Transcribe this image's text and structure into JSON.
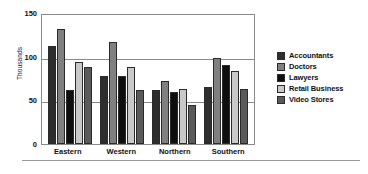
{
  "chart_data": {
    "type": "bar",
    "title": "",
    "xlabel": "",
    "ylabel": "Thousands",
    "ylim": [
      0,
      150
    ],
    "yticks": [
      150,
      100,
      50,
      0
    ],
    "grid": true,
    "legend_position": "right",
    "categories": [
      "Eastern",
      "Western",
      "Northern",
      "Southern"
    ],
    "series": [
      {
        "name": "Accountants",
        "color": "#2e2e2e",
        "values": [
          112,
          78,
          62,
          65
        ]
      },
      {
        "name": "Doctors",
        "color": "#808080",
        "values": [
          132,
          117,
          72,
          98
        ]
      },
      {
        "name": "Lawyers",
        "color": "#0f0f0f",
        "values": [
          62,
          78,
          60,
          90
        ]
      },
      {
        "name": "Retail Business",
        "color": "#c9c9c9",
        "values": [
          94,
          88,
          63,
          84
        ]
      },
      {
        "name": "Video Stores",
        "color": "#5a5a5a",
        "values": [
          88,
          62,
          45,
          63
        ]
      }
    ]
  }
}
